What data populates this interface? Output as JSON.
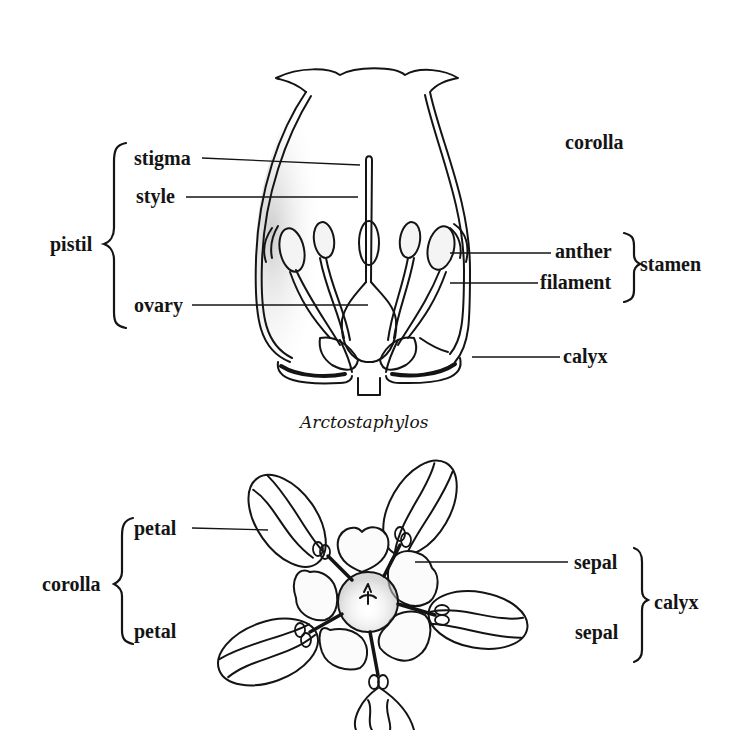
{
  "figure": {
    "top_diagram": {
      "caption": "Arctostaphylos",
      "labels": {
        "corolla": "corolla",
        "stigma": "stigma",
        "style": "style",
        "ovary": "ovary",
        "pistil": "pistil",
        "anther": "anther",
        "filament": "filament",
        "stamen": "stamen",
        "calyx": "calyx"
      }
    },
    "bottom_diagram": {
      "labels": {
        "petal_top": "petal",
        "petal_bottom": "petal",
        "corolla": "corolla",
        "sepal_top": "sepal",
        "sepal_bottom": "sepal",
        "calyx": "calyx"
      }
    },
    "colors": {
      "ink": "#141414",
      "background": "#ffffff",
      "stipple": "#9a9a9a"
    }
  }
}
